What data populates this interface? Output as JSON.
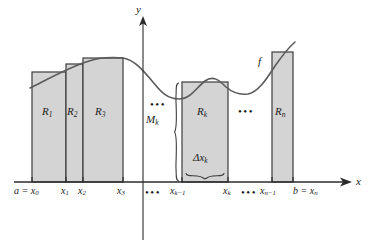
{
  "figure": {
    "colors": {
      "rect_fill": "#d4d4d4",
      "rect_stroke": "#3c3c3c",
      "curve": "#5a5a5a",
      "axis": "#2b2b2b",
      "text": "#1a1a1a"
    }
  },
  "axes": {
    "y_label": "y",
    "x_label": "x",
    "baseline_y": 182,
    "y_axis_x": 143
  },
  "curve": {
    "label": "f",
    "label_x": 258,
    "label_y": 62
  },
  "rectangles": [
    {
      "name": "R1",
      "label_main": "R",
      "label_sub": "1",
      "x": 32,
      "width": 34,
      "top": 72,
      "label_cx": 49,
      "label_cy": 112
    },
    {
      "name": "R2",
      "label_main": "R",
      "label_sub": "2",
      "x": 66,
      "width": 17,
      "top": 64,
      "label_cx": 74,
      "label_cy": 112
    },
    {
      "name": "R3",
      "label_main": "R",
      "label_sub": "3",
      "x": 83,
      "width": 40,
      "top": 58,
      "label_cx": 103,
      "label_cy": 112
    },
    {
      "name": "Rk",
      "label_main": "R",
      "label_sub": "k",
      "x": 182,
      "width": 46,
      "top": 82,
      "label_cx": 205,
      "label_cy": 112
    },
    {
      "name": "Rn",
      "label_main": "R",
      "label_sub": "n",
      "x": 272,
      "width": 21,
      "top": 52,
      "label_cx": 283,
      "label_cy": 112
    }
  ],
  "tick_labels": [
    {
      "id": "a-x0",
      "text": "a = x",
      "sub": "0",
      "x": 14,
      "y": 190,
      "tick_x": 32
    },
    {
      "id": "x1",
      "text": "x",
      "sub": "1",
      "x": 62,
      "y": 190,
      "tick_x": 66
    },
    {
      "id": "x2",
      "text": "x",
      "sub": "2",
      "x": 79,
      "y": 190,
      "tick_x": 83
    },
    {
      "id": "x3",
      "text": "x",
      "sub": "3",
      "x": 118,
      "y": 190,
      "tick_x": 123
    },
    {
      "id": "xk-1",
      "text": "x",
      "sub": "k−1",
      "x": 172,
      "y": 190,
      "tick_x": 182
    },
    {
      "id": "xk",
      "text": "x",
      "sub": "k",
      "x": 224,
      "y": 190,
      "tick_x": 228
    },
    {
      "id": "xn-1",
      "text": "x",
      "sub": "n−1",
      "x": 262,
      "y": 190,
      "tick_x": 272
    },
    {
      "id": "b-xn",
      "text": "b = x",
      "sub": "n",
      "x": 293,
      "y": 190,
      "tick_x": 293
    }
  ],
  "ellipses": [
    {
      "id": "axis-dots-1",
      "text": "•••",
      "x": 147,
      "y": 190
    },
    {
      "id": "axis-dots-2",
      "text": "•••",
      "x": 243,
      "y": 190
    },
    {
      "id": "upper-dots-1",
      "text": "•••",
      "x": 152,
      "y": 104
    },
    {
      "id": "upper-dots-2",
      "text": "•••",
      "x": 240,
      "y": 111
    }
  ],
  "annotations": [
    {
      "id": "Mk",
      "main": "M",
      "sub": "k",
      "x": 146,
      "y": 120,
      "desc": "height of rectangle k"
    },
    {
      "id": "delta-xk",
      "main": "Δx",
      "sub": "k",
      "x": 193,
      "y": 157,
      "desc": "width of rectangle k"
    }
  ],
  "braces": {
    "mk_brace": {
      "x": 176,
      "y_top": 82,
      "y_bottom": 182,
      "orientation": "vertical"
    },
    "dxk_brace": {
      "x_left": 186,
      "x_right": 224,
      "y": 176,
      "orientation": "horizontal"
    }
  }
}
